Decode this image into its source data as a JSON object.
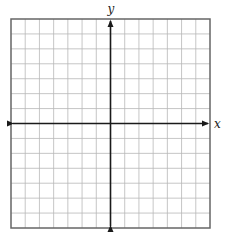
{
  "diagram": {
    "type": "coordinate-plane",
    "grid": {
      "columns": 14,
      "rows": 14,
      "line_color": "#b8b8b8",
      "frame_color": "#666666"
    },
    "axes": {
      "x_label": "x",
      "y_label": "y",
      "color": "#1a1a1a",
      "arrows": [
        "left",
        "right",
        "up",
        "down"
      ]
    },
    "tick_labels": []
  },
  "layout": {
    "frame": {
      "left": 11,
      "top": 19,
      "right": 210,
      "bottom": 228
    }
  }
}
